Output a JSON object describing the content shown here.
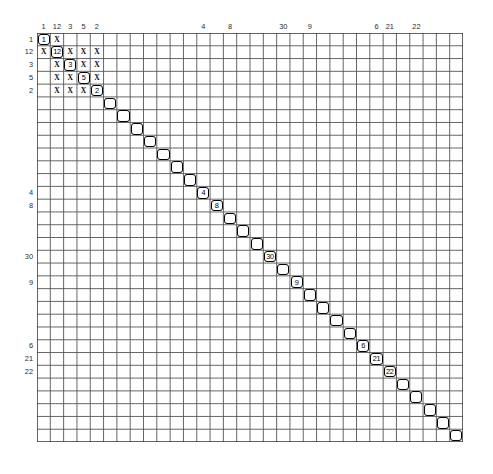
{
  "figure": {
    "kind": "sparse-matrix-sparsity-pattern",
    "grid": {
      "rows": 32,
      "cols": 32,
      "left": 37,
      "top": 33,
      "width": 426,
      "height": 409,
      "line_color": "#555555",
      "bg_color": "#ffffff"
    },
    "marker_color": "#000000"
  },
  "chart_data": {
    "type": "heatmap",
    "title": "",
    "xlabel": "",
    "ylabel": "",
    "rows": 32,
    "cols": 32,
    "grid": true,
    "legend": "none",
    "column_labels": [
      {
        "index": 0,
        "text": "1"
      },
      {
        "index": 1,
        "text": "12"
      },
      {
        "index": 2,
        "text": "3"
      },
      {
        "index": 3,
        "text": "5"
      },
      {
        "index": 4,
        "text": "2"
      },
      {
        "index": 12,
        "text": "4"
      },
      {
        "index": 14,
        "text": "8"
      },
      {
        "index": 18,
        "text": "30"
      },
      {
        "index": 20,
        "text": "9"
      },
      {
        "index": 25,
        "text": "6"
      },
      {
        "index": 26,
        "text": "21"
      },
      {
        "index": 28,
        "text": "22"
      }
    ],
    "row_labels": [
      {
        "index": 0,
        "text": "1"
      },
      {
        "index": 1,
        "text": "12"
      },
      {
        "index": 2,
        "text": "3"
      },
      {
        "index": 3,
        "text": "5"
      },
      {
        "index": 4,
        "text": "2"
      },
      {
        "index": 12,
        "text": "4"
      },
      {
        "index": 13,
        "text": "8"
      },
      {
        "index": 17,
        "text": "30"
      },
      {
        "index": 19,
        "text": "9"
      },
      {
        "index": 24,
        "text": "6"
      },
      {
        "index": 25,
        "text": "21"
      },
      {
        "index": 26,
        "text": "22"
      }
    ],
    "diagonal_cells": [
      {
        "row": 0,
        "col": 0,
        "label": "1"
      },
      {
        "row": 1,
        "col": 1,
        "label": "12"
      },
      {
        "row": 2,
        "col": 2,
        "label": "3"
      },
      {
        "row": 3,
        "col": 3,
        "label": "5"
      },
      {
        "row": 4,
        "col": 4,
        "label": "2"
      },
      {
        "row": 5,
        "col": 5,
        "label": ""
      },
      {
        "row": 6,
        "col": 6,
        "label": ""
      },
      {
        "row": 7,
        "col": 7,
        "label": ""
      },
      {
        "row": 8,
        "col": 8,
        "label": ""
      },
      {
        "row": 9,
        "col": 9,
        "label": ""
      },
      {
        "row": 10,
        "col": 10,
        "label": ""
      },
      {
        "row": 11,
        "col": 11,
        "label": ""
      },
      {
        "row": 12,
        "col": 12,
        "label": "4"
      },
      {
        "row": 13,
        "col": 13,
        "label": "8"
      },
      {
        "row": 14,
        "col": 14,
        "label": ""
      },
      {
        "row": 15,
        "col": 15,
        "label": ""
      },
      {
        "row": 16,
        "col": 16,
        "label": ""
      },
      {
        "row": 17,
        "col": 17,
        "label": "30"
      },
      {
        "row": 18,
        "col": 18,
        "label": ""
      },
      {
        "row": 19,
        "col": 19,
        "label": "9"
      },
      {
        "row": 20,
        "col": 20,
        "label": ""
      },
      {
        "row": 21,
        "col": 21,
        "label": ""
      },
      {
        "row": 22,
        "col": 22,
        "label": ""
      },
      {
        "row": 23,
        "col": 23,
        "label": ""
      },
      {
        "row": 24,
        "col": 24,
        "label": "6"
      },
      {
        "row": 25,
        "col": 25,
        "label": "21"
      },
      {
        "row": 26,
        "col": 26,
        "label": "22"
      },
      {
        "row": 27,
        "col": 27,
        "label": ""
      },
      {
        "row": 28,
        "col": 28,
        "label": ""
      },
      {
        "row": 29,
        "col": 29,
        "label": ""
      },
      {
        "row": 30,
        "col": 30,
        "label": ""
      },
      {
        "row": 31,
        "col": 31,
        "label": ""
      }
    ],
    "offdiagonal_marks": [
      {
        "row": 0,
        "col": 1,
        "mark": "X"
      },
      {
        "row": 1,
        "col": 0,
        "mark": "X"
      },
      {
        "row": 1,
        "col": 2,
        "mark": "X"
      },
      {
        "row": 1,
        "col": 3,
        "mark": "X"
      },
      {
        "row": 1,
        "col": 4,
        "mark": "X"
      },
      {
        "row": 2,
        "col": 1,
        "mark": "X"
      },
      {
        "row": 2,
        "col": 3,
        "mark": "X"
      },
      {
        "row": 2,
        "col": 4,
        "mark": "X"
      },
      {
        "row": 3,
        "col": 1,
        "mark": "X"
      },
      {
        "row": 3,
        "col": 2,
        "mark": "X"
      },
      {
        "row": 3,
        "col": 4,
        "mark": "X"
      },
      {
        "row": 4,
        "col": 1,
        "mark": "X"
      },
      {
        "row": 4,
        "col": 2,
        "mark": "X"
      },
      {
        "row": 4,
        "col": 3,
        "mark": "X"
      }
    ]
  }
}
